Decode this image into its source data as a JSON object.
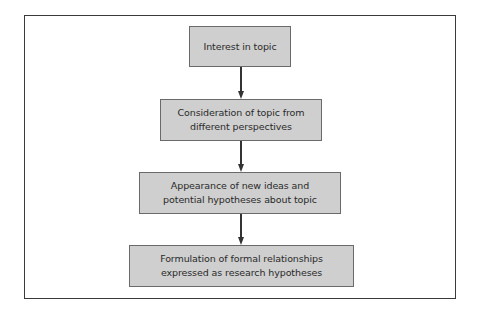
{
  "diagram": {
    "type": "flowchart",
    "direction": "top-to-bottom",
    "nodes": [
      {
        "id": "n1",
        "label": "Interest in topic"
      },
      {
        "id": "n2",
        "label": "Consideration of topic from\ndifferent perspectives"
      },
      {
        "id": "n3",
        "label": "Appearance of new ideas and\npotential hypotheses about topic"
      },
      {
        "id": "n4",
        "label": "Formulation of formal relationships\nexpressed as research hypotheses"
      }
    ],
    "edges": [
      {
        "from": "n1",
        "to": "n2"
      },
      {
        "from": "n2",
        "to": "n3"
      },
      {
        "from": "n3",
        "to": "n4"
      }
    ],
    "colors": {
      "node_fill": "#cfcfcf",
      "node_border": "#6a6a6a",
      "arrow": "#333333",
      "frame_border": "#3a3a3a"
    }
  }
}
